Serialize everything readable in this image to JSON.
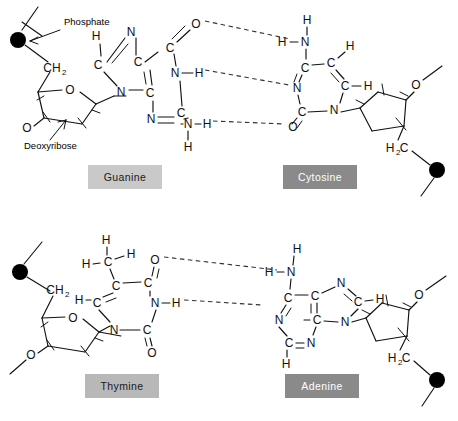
{
  "figure": {
    "background": "#ffffff",
    "width": 458,
    "height": 421
  },
  "annotations": [
    {
      "name": "phosphate",
      "text": "Phosphate"
    },
    {
      "name": "deoxyribose",
      "text": "Deoxyribose"
    }
  ],
  "base_labels": [
    {
      "name": "guanine",
      "text": "Guanine",
      "bg": "#c9c9c9",
      "fg": "#1a1a1a",
      "x": 88,
      "y": 165,
      "w": 74,
      "h": 24
    },
    {
      "name": "cytosine",
      "text": "Cytosine",
      "bg": "#8a8a8a",
      "fg": "#ffffff",
      "x": 283,
      "y": 165,
      "w": 74,
      "h": 24
    },
    {
      "name": "thymine",
      "text": "Thymine",
      "bg": "#b8b8b8",
      "fg": "#1a1a1a",
      "x": 85,
      "y": 374,
      "w": 74,
      "h": 24
    },
    {
      "name": "adenine",
      "text": "Adenine",
      "bg": "#8a8a8a",
      "fg": "#ffffff",
      "x": 285,
      "y": 374,
      "w": 74,
      "h": 24
    }
  ],
  "pairs": [
    {
      "name": "guanine-cytosine",
      "left_base": "Guanine",
      "right_base": "Cytosine",
      "hydrogen_bonds": 3
    },
    {
      "name": "thymine-adenine",
      "left_base": "Thymine",
      "right_base": "Adenine",
      "hydrogen_bonds": 2
    }
  ],
  "atoms": {
    "guanine": [
      {
        "t": "H",
        "x": 96,
        "y": 36
      },
      {
        "t": "N",
        "x": 131,
        "y": 32
      },
      {
        "t": "C",
        "x": 98,
        "y": 65
      },
      {
        "t": "C",
        "x": 138,
        "y": 62
      },
      {
        "t": "C",
        "x": 170,
        "y": 48
      },
      {
        "t": "O",
        "x": 196,
        "y": 24
      },
      {
        "t": "N",
        "x": 121,
        "y": 92
      },
      {
        "t": "C",
        "x": 150,
        "y": 93
      },
      {
        "t": "N",
        "x": 175,
        "y": 73
      },
      {
        "t": "H",
        "x": 199,
        "y": 73
      },
      {
        "t": "N",
        "x": 151,
        "y": 119
      },
      {
        "t": "C",
        "x": 181,
        "y": 113
      },
      {
        "t": "N",
        "x": 188,
        "y": 124
      },
      {
        "t": "H",
        "x": 207,
        "y": 124
      },
      {
        "t": "H",
        "x": 188,
        "y": 147
      }
    ],
    "cytosine": [
      {
        "t": "H",
        "x": 307,
        "y": 20
      },
      {
        "t": "N",
        "x": 305,
        "y": 42
      },
      {
        "t": "H",
        "x": 282,
        "y": 42
      },
      {
        "t": "C",
        "x": 305,
        "y": 68
      },
      {
        "t": "C",
        "x": 331,
        "y": 63
      },
      {
        "t": "H",
        "x": 350,
        "y": 46
      },
      {
        "t": "C",
        "x": 345,
        "y": 86
      },
      {
        "t": "H",
        "x": 368,
        "y": 86
      },
      {
        "t": "N",
        "x": 297,
        "y": 88
      },
      {
        "t": "C",
        "x": 302,
        "y": 112
      },
      {
        "t": "N",
        "x": 334,
        "y": 110
      },
      {
        "t": "O",
        "x": 293,
        "y": 127
      }
    ],
    "thymine": [
      {
        "t": "H",
        "x": 106,
        "y": 240
      },
      {
        "t": "C",
        "x": 108,
        "y": 262
      },
      {
        "t": "H",
        "x": 131,
        "y": 254
      },
      {
        "t": "H",
        "x": 86,
        "y": 264
      },
      {
        "t": "C",
        "x": 116,
        "y": 286
      },
      {
        "t": "C",
        "x": 148,
        "y": 283
      },
      {
        "t": "O",
        "x": 155,
        "y": 260
      },
      {
        "t": "C",
        "x": 97,
        "y": 303
      },
      {
        "t": "H",
        "x": 79,
        "y": 300
      },
      {
        "t": "N",
        "x": 155,
        "y": 303
      },
      {
        "t": "H",
        "x": 176,
        "y": 303
      },
      {
        "t": "N",
        "x": 114,
        "y": 330
      },
      {
        "t": "C",
        "x": 147,
        "y": 330
      },
      {
        "t": "O",
        "x": 152,
        "y": 353
      }
    ],
    "adenine": [
      {
        "t": "H",
        "x": 297,
        "y": 249
      },
      {
        "t": "N",
        "x": 291,
        "y": 272
      },
      {
        "t": "H",
        "x": 269,
        "y": 272
      },
      {
        "t": "C",
        "x": 288,
        "y": 298
      },
      {
        "t": "C",
        "x": 315,
        "y": 296
      },
      {
        "t": "N",
        "x": 341,
        "y": 283
      },
      {
        "t": "C",
        "x": 358,
        "y": 302
      },
      {
        "t": "H",
        "x": 380,
        "y": 299
      },
      {
        "t": "N",
        "x": 279,
        "y": 320
      },
      {
        "t": "C",
        "x": 317,
        "y": 320
      },
      {
        "t": "N",
        "x": 345,
        "y": 322
      },
      {
        "t": "C",
        "x": 289,
        "y": 343
      },
      {
        "t": "N",
        "x": 311,
        "y": 343
      },
      {
        "t": "H",
        "x": 286,
        "y": 364
      }
    ],
    "sugar_labels": [
      {
        "t": "CH",
        "sub": "2",
        "x": 52,
        "y": 68
      },
      {
        "t": "O",
        "sub": "",
        "x": 70,
        "y": 90
      },
      {
        "t": "O",
        "sub": "",
        "x": 27,
        "y": 128
      },
      {
        "t": "O",
        "sub": "",
        "x": 416,
        "y": 85
      },
      {
        "t": "H",
        "sub": "2",
        "x": 390,
        "y": 148
      },
      {
        "t": "C",
        "sub": "",
        "x": 404,
        "y": 148
      },
      {
        "t": "CH",
        "sub": "2",
        "x": 55,
        "y": 290
      },
      {
        "t": "O",
        "sub": "",
        "x": 73,
        "y": 318
      },
      {
        "t": "O",
        "sub": "",
        "x": 31,
        "y": 355
      },
      {
        "t": "O",
        "sub": "",
        "x": 419,
        "y": 295
      },
      {
        "t": "H",
        "sub": "2",
        "x": 392,
        "y": 358
      },
      {
        "t": "C",
        "sub": "",
        "x": 406,
        "y": 358
      }
    ]
  }
}
